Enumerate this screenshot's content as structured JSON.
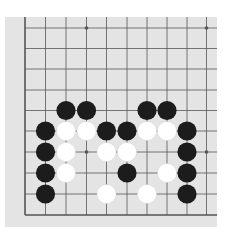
{
  "board": {
    "background": "#e4e4e4",
    "line_color": "#555555",
    "grid_x": [
      25,
      45.5,
      66,
      86.5,
      106.5,
      127,
      147,
      167,
      187,
      206.5
    ],
    "grid_y": [
      28,
      48.5,
      69,
      90,
      110.5,
      131,
      152,
      173,
      194,
      215
    ],
    "edges": {
      "left": true,
      "bottom": true,
      "top": false,
      "right": false
    },
    "star_points": [
      [
        3,
        0
      ],
      [
        9,
        0
      ],
      [
        3,
        6
      ],
      [
        9,
        6
      ]
    ],
    "stones": [
      {
        "c": 2,
        "r": 4,
        "color": "black"
      },
      {
        "c": 3,
        "r": 4,
        "color": "black"
      },
      {
        "c": 6,
        "r": 4,
        "color": "black"
      },
      {
        "c": 7,
        "r": 4,
        "color": "black"
      },
      {
        "c": 1,
        "r": 5,
        "color": "black"
      },
      {
        "c": 2,
        "r": 5,
        "color": "white"
      },
      {
        "c": 3,
        "r": 5,
        "color": "white"
      },
      {
        "c": 4,
        "r": 5,
        "color": "black"
      },
      {
        "c": 5,
        "r": 5,
        "color": "black"
      },
      {
        "c": 6,
        "r": 5,
        "color": "white"
      },
      {
        "c": 7,
        "r": 5,
        "color": "white"
      },
      {
        "c": 8,
        "r": 5,
        "color": "black"
      },
      {
        "c": 1,
        "r": 6,
        "color": "black"
      },
      {
        "c": 2,
        "r": 6,
        "color": "white"
      },
      {
        "c": 4,
        "r": 6,
        "color": "white"
      },
      {
        "c": 5,
        "r": 6,
        "color": "white"
      },
      {
        "c": 8,
        "r": 6,
        "color": "black"
      },
      {
        "c": 1,
        "r": 7,
        "color": "black"
      },
      {
        "c": 2,
        "r": 7,
        "color": "white"
      },
      {
        "c": 5,
        "r": 7,
        "color": "black"
      },
      {
        "c": 7,
        "r": 7,
        "color": "white"
      },
      {
        "c": 8,
        "r": 7,
        "color": "black"
      },
      {
        "c": 1,
        "r": 8,
        "color": "black"
      },
      {
        "c": 4,
        "r": 8,
        "color": "white"
      },
      {
        "c": 6,
        "r": 8,
        "color": "white"
      },
      {
        "c": 8,
        "r": 8,
        "color": "black"
      }
    ]
  }
}
